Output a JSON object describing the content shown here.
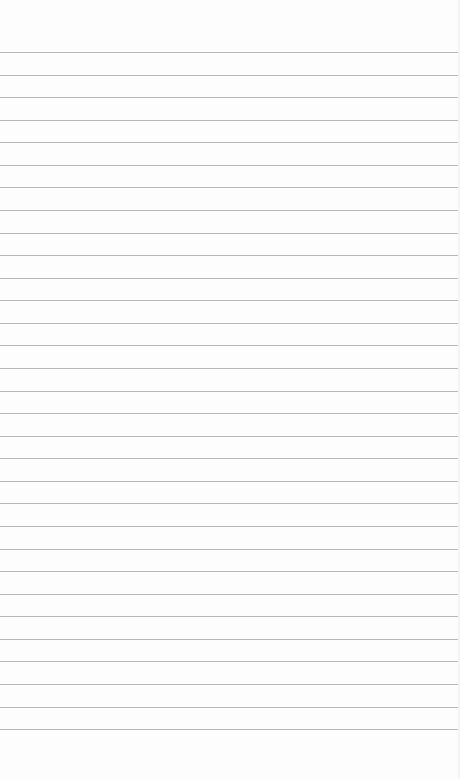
{
  "page": {
    "type": "lined-paper",
    "background_color": "#fdfdfd",
    "line_color": "#a9a9a9",
    "line_count": 31,
    "first_line_y": 52,
    "line_spacing": 22.57
  }
}
